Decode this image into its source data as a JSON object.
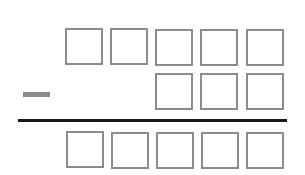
{
  "problem": {
    "operation": "subtraction",
    "operator_symbol": "-",
    "minuend_boxes": 5,
    "subtrahend_boxes": 3,
    "difference_boxes": 5,
    "box_values": {
      "minuend": [
        "",
        "",
        "",
        "",
        ""
      ],
      "subtrahend": [
        "",
        "",
        ""
      ],
      "difference": [
        "",
        "",
        "",
        "",
        ""
      ]
    }
  },
  "colors": {
    "box_border": "#8c8c8c",
    "minus_sign": "#8a8a8a",
    "rule_line": "#1a1a1a",
    "background": "#ffffff"
  }
}
